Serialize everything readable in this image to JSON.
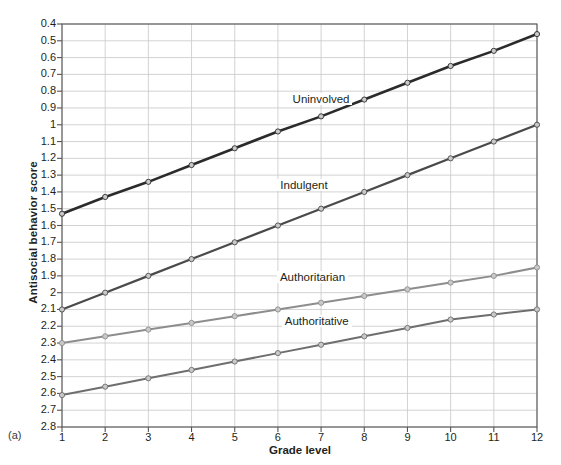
{
  "figure": {
    "panel_letter": "(a)",
    "xlabel": "Grade level",
    "ylabel": "Antisocial behavior score"
  },
  "axes": {
    "y_ticks": [
      "2.8",
      "2.7",
      "2.6",
      "2.5",
      "2.4",
      "2.3",
      "2.2",
      "2.1",
      "2",
      "1.9",
      "1.8",
      "1.7",
      "1.6",
      "1.5",
      "1.4",
      "1.3",
      "1.2",
      "1.1",
      "1",
      "0.9",
      "0.8",
      "0.7",
      "0.6",
      "0.5",
      "0.4"
    ],
    "x_ticks": [
      "1",
      "2",
      "3",
      "4",
      "5",
      "6",
      "7",
      "8",
      "9",
      "10",
      "11",
      "12"
    ]
  },
  "series_labels": {
    "uninvolved": "Uninvolved",
    "indulgent": "Indulgent",
    "authoritarian": "Authoritarian",
    "authoritative": "Authoritative"
  },
  "colors": {
    "uninvolved": "#2b2b2b",
    "indulgent": "#4a4a4a",
    "authoritarian": "#8d8d8d",
    "authoritative": "#6e6e6e",
    "grid": "#c8c8c8",
    "axis": "#555555",
    "marker_fill": "#c9c9c9",
    "background": "#ffffff",
    "text": "#231f20"
  },
  "chart_data": {
    "type": "line",
    "title": "",
    "xlabel": "Grade level",
    "ylabel": "Antisocial behavior score",
    "x": [
      1,
      2,
      3,
      4,
      5,
      6,
      7,
      8,
      9,
      10,
      11,
      12
    ],
    "xlim": [
      1,
      12
    ],
    "ylim": [
      0.4,
      2.8
    ],
    "ytick_step": 0.1,
    "grid": true,
    "legend": "inline-annotations",
    "series": [
      {
        "name": "Uninvolved",
        "color": "#2b2b2b",
        "values": [
          1.67,
          1.77,
          1.86,
          1.96,
          2.06,
          2.16,
          2.25,
          2.35,
          2.45,
          2.55,
          2.64,
          2.74
        ]
      },
      {
        "name": "Indulgent",
        "color": "#4a4a4a",
        "values": [
          1.1,
          1.2,
          1.3,
          1.4,
          1.5,
          1.6,
          1.7,
          1.8,
          1.9,
          2.0,
          2.1,
          2.2
        ]
      },
      {
        "name": "Authoritarian",
        "color": "#8d8d8d",
        "values": [
          0.9,
          0.94,
          0.98,
          1.02,
          1.06,
          1.1,
          1.14,
          1.18,
          1.22,
          1.26,
          1.3,
          1.35
        ]
      },
      {
        "name": "Authoritative",
        "color": "#6e6e6e",
        "values": [
          0.59,
          0.64,
          0.69,
          0.74,
          0.79,
          0.84,
          0.89,
          0.94,
          0.99,
          1.04,
          1.07,
          1.1
        ]
      }
    ],
    "annotations": [
      {
        "text": "Uninvolved",
        "x": 7.0,
        "y": 2.34
      },
      {
        "text": "Indulgent",
        "x": 6.6,
        "y": 1.83
      },
      {
        "text": "Authoritarian",
        "x": 6.8,
        "y": 1.28
      },
      {
        "text": "Authoritative",
        "x": 6.9,
        "y": 1.02
      }
    ]
  }
}
